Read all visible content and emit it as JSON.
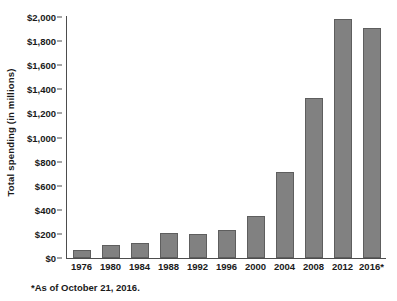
{
  "chart_data": {
    "type": "bar",
    "title": "",
    "subtitle": "",
    "xlabel": "",
    "ylabel": "Total spending (in millions)",
    "categories": [
      "1976",
      "1980",
      "1984",
      "1988",
      "1992",
      "1996",
      "2000",
      "2004",
      "2008",
      "2012",
      "2016*"
    ],
    "values": [
      66,
      108,
      125,
      210,
      200,
      235,
      350,
      715,
      1330,
      1985,
      1910
    ],
    "ylim": [
      0,
      2000
    ],
    "ytick_values": [
      0,
      200,
      400,
      600,
      800,
      1000,
      1200,
      1400,
      1600,
      1800,
      2000
    ],
    "ytick_labels": [
      "$0",
      "$200",
      "$400",
      "$600",
      "$800",
      "$1,000",
      "$1,200",
      "$1,400",
      "$1,600",
      "$1,800",
      "$2,000"
    ],
    "grid": false,
    "legend": null,
    "bar_color": "#818181",
    "bar_border_color": "#5e5e5e",
    "axis_color": "#4d4d4d",
    "annotations": [
      "*As of October 21, 2016."
    ]
  },
  "figure": {
    "footnote": "*As of October 21, 2016."
  }
}
